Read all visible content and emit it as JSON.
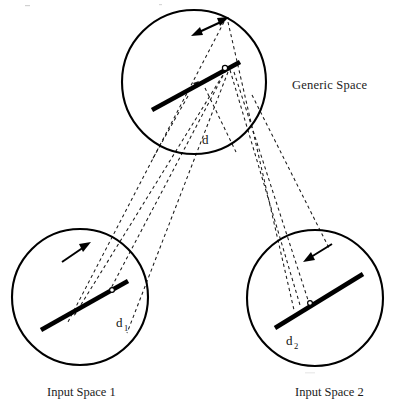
{
  "diagram": {
    "type": "conceptual-blending-network",
    "title_visible": false,
    "background_color": "#ffffff",
    "stroke_color": "#000000",
    "canvas": {
      "width": 393,
      "height": 407
    },
    "spaces": [
      {
        "id": "generic",
        "label": "Generic Space",
        "label_x": 292,
        "label_y": 89,
        "circle": {
          "cx": 194,
          "cy": 82,
          "r": 72
        },
        "vector": {
          "x1": 152,
          "y1": 110,
          "x2": 240,
          "y2": 62
        },
        "node": {
          "cx": 225,
          "cy": 68,
          "r": 2.6
        },
        "arrow": {
          "kind": "double-headed",
          "x1": 194,
          "y1": 34,
          "x2": 226,
          "y2": 19
        },
        "element_label": "d",
        "element_label_x": 202,
        "element_label_y": 144
      },
      {
        "id": "input1",
        "label": "Input Space 1",
        "label_x": 47,
        "label_y": 394,
        "circle": {
          "cx": 80,
          "cy": 297,
          "r": 68
        },
        "vector": {
          "x1": 41,
          "y1": 330,
          "x2": 128,
          "y2": 281
        },
        "node": {
          "cx": 113,
          "cy": 289,
          "r": 2.4
        },
        "arrow": {
          "kind": "single-headed",
          "x1": 62,
          "y1": 260,
          "x2": 89,
          "y2": 243
        },
        "element_label": "d",
        "element_label_sub": "1",
        "element_label_x": 116,
        "element_label_y": 327
      },
      {
        "id": "input2",
        "label": "Input Space 2",
        "label_x": 295,
        "label_y": 394,
        "circle": {
          "cx": 315,
          "cy": 298,
          "r": 68
        },
        "vector": {
          "x1": 275,
          "y1": 328,
          "x2": 363,
          "y2": 274
        },
        "node": {
          "cx": 310,
          "cy": 303,
          "r": 2.4
        },
        "arrow": {
          "kind": "single-headed",
          "x1": 330,
          "y1": 245,
          "x2": 303,
          "y2": 262
        },
        "element_label": "d",
        "element_label_sub": "2",
        "element_label_x": 287,
        "element_label_y": 345
      }
    ],
    "projections": [
      {
        "from": "generic",
        "to": "input1",
        "x1": 226,
        "y1": 19,
        "x2": 72,
        "y2": 318
      },
      {
        "from": "generic",
        "to": "input1",
        "x1": 226,
        "y1": 68,
        "x2": 76,
        "y2": 313
      },
      {
        "from": "generic",
        "to": "input1",
        "x1": 226,
        "y1": 68,
        "x2": 113,
        "y2": 289
      },
      {
        "from": "generic",
        "to": "input1",
        "x1": 226,
        "y1": 68,
        "x2": 128,
        "y2": 330
      },
      {
        "from": "generic",
        "to": "input2",
        "x1": 226,
        "y1": 19,
        "x2": 296,
        "y2": 306
      },
      {
        "from": "generic",
        "to": "input2",
        "x1": 226,
        "y1": 68,
        "x2": 300,
        "y2": 300
      },
      {
        "from": "generic",
        "to": "input2",
        "x1": 226,
        "y1": 68,
        "x2": 310,
        "y2": 303
      },
      {
        "from": "generic",
        "to": "input2",
        "x1": 250,
        "y1": 92,
        "x2": 332,
        "y2": 250
      }
    ],
    "notes": {
      "dash_pattern": "3.2 3.0",
      "vector_stroke_width": 4.6,
      "circle_stroke_width": 2.1
    }
  }
}
